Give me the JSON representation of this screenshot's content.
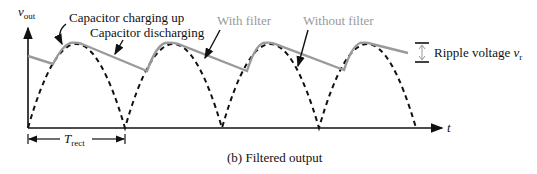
{
  "diagram": {
    "caption": "(b) Filtered output",
    "y_axis_label": "v",
    "y_axis_subscript": "out",
    "x_axis_label": "t",
    "annotations": {
      "charging": "Capacitor charging up",
      "discharging": "Capacitor discharging",
      "with_filter": "With filter",
      "without_filter": "Without filter",
      "ripple": "Ripple voltage ",
      "ripple_symbol": "v",
      "ripple_subscript": "r",
      "period": "T",
      "period_subscript": "rect"
    },
    "colors": {
      "filtered": "#9a9a9a",
      "unfiltered": "#111111",
      "axes": "#111111"
    }
  }
}
